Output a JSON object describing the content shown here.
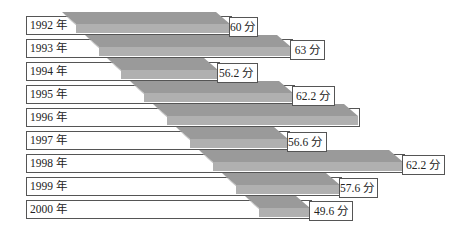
{
  "chart_data": {
    "type": "bar",
    "orientation": "horizontal-3d",
    "title": "",
    "xlabel": "",
    "ylabel": "",
    "categories": [
      "1992 年",
      "1993 年",
      "1994 年",
      "1995 年",
      "1996 年",
      "1997 年",
      "1998 年",
      "1999 年",
      "2000 年"
    ],
    "values": [
      60,
      63,
      56.2,
      62.2,
      null,
      56.6,
      62.2,
      57.6,
      49.6
    ],
    "value_labels": [
      "60 分",
      "63 分",
      "56.2 分",
      "62.2 分",
      "",
      "56.6 分",
      "62.2 分",
      "57.6 分",
      "49.6 分"
    ],
    "grid": false,
    "legend": null
  },
  "colors": {
    "bar_top": "#9a9a9a",
    "bar_front": "#b0b0b0",
    "bar_side": "#c4c4c4",
    "border": "#555555",
    "text": "#222222"
  },
  "layout": {
    "rows": [
      {
        "y": 16,
        "bar_left": 62,
        "bar_right": 230,
        "box_right": 258
      },
      {
        "y": 39,
        "bar_left": 85,
        "bar_right": 291,
        "box_right": 325
      },
      {
        "y": 62,
        "bar_left": 107,
        "bar_right": 218,
        "box_right": 258
      },
      {
        "y": 85,
        "bar_left": 130,
        "bar_right": 293,
        "box_right": 335
      },
      {
        "y": 108,
        "bar_left": 153,
        "bar_right": 358,
        "box_right": 358
      },
      {
        "y": 131,
        "bar_left": 176,
        "bar_right": 288,
        "box_right": 327
      },
      {
        "y": 154,
        "bar_left": 199,
        "bar_right": 403,
        "box_right": 445
      },
      {
        "y": 177,
        "bar_left": 222,
        "bar_right": 340,
        "box_right": 378
      },
      {
        "y": 200,
        "bar_left": 245,
        "bar_right": 310,
        "box_right": 353
      }
    ]
  }
}
